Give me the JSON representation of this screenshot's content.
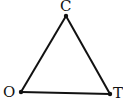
{
  "diagram": {
    "type": "triangle",
    "stroke_color": "#111111",
    "vertices": [
      {
        "id": "C",
        "label": "C",
        "x": 66,
        "y": 16
      },
      {
        "id": "O",
        "label": "O",
        "x": 21,
        "y": 92
      },
      {
        "id": "T",
        "label": "T",
        "x": 110,
        "y": 94
      }
    ],
    "edges": [
      [
        "C",
        "O"
      ],
      [
        "O",
        "T"
      ],
      [
        "T",
        "C"
      ]
    ]
  }
}
